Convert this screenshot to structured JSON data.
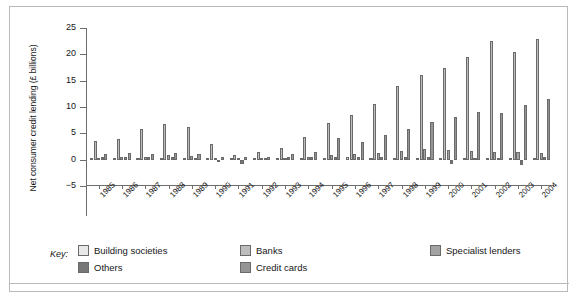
{
  "chart_data": {
    "type": "bar",
    "title": "",
    "xlabel": "",
    "ylabel": "Net consumer credit lending (£ billions)",
    "ylim": [
      -5,
      25
    ],
    "yticks": [
      -5,
      0,
      5,
      10,
      15,
      20,
      25
    ],
    "ytick_labels": [
      "−5",
      "0",
      "5",
      "10",
      "15",
      "20",
      "25"
    ],
    "grid": false,
    "legend_position": "bottom-left",
    "legend_title": "Key:",
    "categories": [
      "1985",
      "1986",
      "1987",
      "1988",
      "1989",
      "1990",
      "1991",
      "1992",
      "1993",
      "1994",
      "1995",
      "1996",
      "1997",
      "1998",
      "1999",
      "2000",
      "2001",
      "2002",
      "2003",
      "2004"
    ],
    "series": [
      {
        "name": "Building societies",
        "color": "#e8e8e8",
        "values": [
          0.2,
          0.3,
          0.3,
          0.4,
          0.3,
          0.2,
          0.2,
          0.1,
          0.2,
          0.3,
          0.4,
          0.5,
          0.4,
          0.4,
          0.4,
          0.3,
          0.3,
          0.3,
          0.3,
          0.3
        ]
      },
      {
        "name": "Banks",
        "color": "#bdbdbd",
        "values": [
          3.5,
          3.9,
          5.9,
          6.7,
          6.2,
          3.0,
          0.8,
          1.4,
          2.3,
          4.4,
          7.0,
          8.5,
          10.5,
          14.0,
          16.0,
          17.5,
          19.5,
          22.5,
          20.5,
          23.0
        ]
      },
      {
        "name": "Specialist lenders",
        "color": "#a3a3a3",
        "values": [
          0.4,
          0.5,
          0.6,
          0.8,
          0.7,
          0.4,
          0.2,
          0.3,
          0.4,
          0.6,
          0.8,
          1.1,
          1.3,
          1.7,
          2.0,
          1.9,
          1.7,
          1.5,
          1.4,
          1.3
        ]
      },
      {
        "name": "Others",
        "color": "#777777",
        "values": [
          0.6,
          0.5,
          0.5,
          0.5,
          0.3,
          -0.4,
          -0.8,
          0.3,
          0.5,
          0.6,
          0.5,
          0.6,
          0.5,
          0.6,
          0.6,
          -0.9,
          0.4,
          0.4,
          -1.1,
          0.5
        ]
      },
      {
        "name": "Credit cards",
        "color": "#949494",
        "values": [
          1.1,
          1.2,
          1.1,
          1.2,
          1.0,
          0.6,
          0.5,
          0.6,
          1.1,
          1.5,
          4.1,
          3.3,
          4.6,
          5.9,
          7.2,
          8.2,
          9.0,
          8.9,
          10.3,
          11.6
        ]
      }
    ]
  }
}
